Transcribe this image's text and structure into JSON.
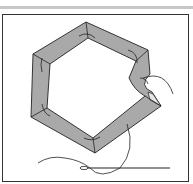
{
  "illustration": {
    "subject": "hexagon fabric patch basted over paper template with needle and thread",
    "colors": {
      "fabric": "#a9a9a9",
      "outline": "#222222",
      "top_bar": "#c8c8c8",
      "background": "#ffffff"
    },
    "elements": [
      "top-rule",
      "frame",
      "hexagon-patch",
      "basting-stitches",
      "thread",
      "needle"
    ]
  }
}
